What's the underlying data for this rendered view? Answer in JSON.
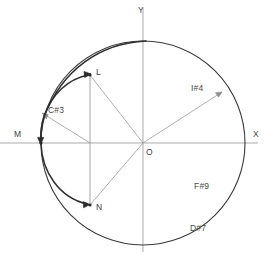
{
  "figure": {
    "title": "",
    "type": "geometric-diagram",
    "background_color": "#ffffff",
    "axes": {
      "x_label": "X",
      "y_label": "Y",
      "origin_label": "O",
      "axis_color": "#a9a9a9"
    },
    "circle": {
      "center_x": 143,
      "center_y": 143,
      "radius": 102,
      "stroke_color": "#3a3a3a"
    },
    "points": [
      {
        "name": "L",
        "label": "L",
        "x": 90,
        "y": 75
      },
      {
        "name": "M",
        "label": "M",
        "x": 41,
        "y": 143
      },
      {
        "name": "N",
        "label": "N",
        "x": 90,
        "y": 205
      },
      {
        "name": "O",
        "label": "O",
        "x": 143,
        "y": 143
      }
    ],
    "annotations": [
      {
        "name": "c3",
        "label": "C#3",
        "x": 48,
        "y": 110
      },
      {
        "name": "i4",
        "label": "I#4",
        "x": 191,
        "y": 88
      },
      {
        "name": "f9",
        "label": "F#9",
        "x": 194,
        "y": 186
      },
      {
        "name": "d7",
        "label": "D#7",
        "x": 190,
        "y": 228
      }
    ],
    "colors": {
      "arc_stroke": "#2f2f2f",
      "ray_stroke": "#9a9a9a",
      "axis_stroke": "#ababab",
      "text": "#4a4a4a"
    }
  }
}
